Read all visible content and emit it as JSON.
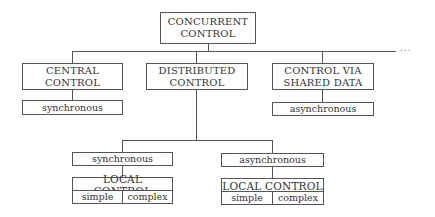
{
  "diagram": {
    "root": {
      "line1": "CONCURRENT",
      "line2": "CONTROL"
    },
    "ellipsis": "...",
    "branches": [
      {
        "line1": "CENTRAL",
        "line2": "CONTROL",
        "child": "synchronous"
      },
      {
        "line1": "DISTRIBUTED",
        "line2": "CONTROL"
      },
      {
        "line1": "CONTROL VIA",
        "line2": "SHARED DATA",
        "child": "asynchronous"
      }
    ],
    "distributed_children": [
      {
        "label": "synchronous",
        "local": {
          "title": "LOCAL CONTROL",
          "left": "simple",
          "right": "complex"
        }
      },
      {
        "label": "asynchronous",
        "local": {
          "title": "LOCAL CONTROL",
          "left": "simple",
          "right": "complex"
        }
      }
    ]
  }
}
